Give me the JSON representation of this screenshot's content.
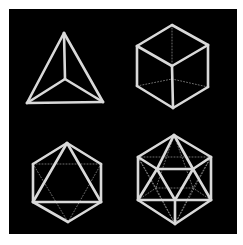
{
  "colors": {
    "background": "#000000",
    "page": "#ffffff",
    "edge": "#d9d9d9",
    "hidden_edge": "#8a8a8a"
  },
  "solids": [
    {
      "name": "tetrahedron",
      "visible_edges": [
        [
          [
            64,
            33
          ],
          [
            27,
            103
          ]
        ],
        [
          [
            64,
            33
          ],
          [
            103,
            102
          ]
        ],
        [
          [
            27,
            103
          ],
          [
            103,
            102
          ]
        ],
        [
          [
            64,
            33
          ],
          [
            65,
            79
          ]
        ],
        [
          [
            27,
            103
          ],
          [
            65,
            79
          ]
        ],
        [
          [
            103,
            102
          ],
          [
            65,
            79
          ]
        ]
      ],
      "hidden_edges": []
    },
    {
      "name": "cube",
      "visible_edges": [
        [
          [
            172,
            25
          ],
          [
            137,
            46
          ]
        ],
        [
          [
            172,
            25
          ],
          [
            208,
            45
          ]
        ],
        [
          [
            137,
            46
          ],
          [
            172,
            66
          ]
        ],
        [
          [
            208,
            45
          ],
          [
            172,
            66
          ]
        ],
        [
          [
            137,
            46
          ],
          [
            137,
            86
          ]
        ],
        [
          [
            208,
            45
          ],
          [
            208,
            87
          ]
        ],
        [
          [
            172,
            66
          ],
          [
            173,
            108
          ]
        ],
        [
          [
            137,
            86
          ],
          [
            173,
            108
          ]
        ],
        [
          [
            208,
            87
          ],
          [
            173,
            108
          ]
        ]
      ],
      "hidden_edges": [
        [
          [
            172,
            25
          ],
          [
            172,
            79
          ]
        ],
        [
          [
            137,
            86
          ],
          [
            172,
            79
          ]
        ],
        [
          [
            208,
            87
          ],
          [
            172,
            79
          ]
        ]
      ]
    },
    {
      "name": "octahedron",
      "visible_edges": [
        [
          [
            67,
            143
          ],
          [
            33,
            164
          ]
        ],
        [
          [
            67,
            143
          ],
          [
            101,
            164
          ]
        ],
        [
          [
            33,
            164
          ],
          [
            33,
            202
          ]
        ],
        [
          [
            101,
            164
          ],
          [
            101,
            202
          ]
        ],
        [
          [
            33,
            202
          ],
          [
            68,
            222
          ]
        ],
        [
          [
            101,
            202
          ],
          [
            68,
            222
          ]
        ],
        [
          [
            67,
            143
          ],
          [
            33,
            202
          ]
        ],
        [
          [
            67,
            143
          ],
          [
            101,
            202
          ]
        ],
        [
          [
            33,
            202
          ],
          [
            101,
            202
          ]
        ]
      ],
      "hidden_edges": [
        [
          [
            33,
            164
          ],
          [
            101,
            164
          ]
        ],
        [
          [
            33,
            164
          ],
          [
            68,
            222
          ]
        ],
        [
          [
            101,
            164
          ],
          [
            68,
            222
          ]
        ]
      ]
    },
    {
      "name": "icosahedron",
      "visible_edges": [
        [
          [
            174,
            135
          ],
          [
            138,
            157
          ]
        ],
        [
          [
            174,
            135
          ],
          [
            211,
            157
          ]
        ],
        [
          [
            138,
            157
          ],
          [
            138,
            200
          ]
        ],
        [
          [
            211,
            157
          ],
          [
            211,
            200
          ]
        ],
        [
          [
            138,
            200
          ],
          [
            175,
            224
          ]
        ],
        [
          [
            211,
            200
          ],
          [
            175,
            224
          ]
        ],
        [
          [
            174,
            135
          ],
          [
            157,
            169
          ]
        ],
        [
          [
            174,
            135
          ],
          [
            193,
            169
          ]
        ],
        [
          [
            157,
            169
          ],
          [
            193,
            169
          ]
        ],
        [
          [
            157,
            169
          ],
          [
            175,
            200
          ]
        ],
        [
          [
            193,
            169
          ],
          [
            175,
            200
          ]
        ],
        [
          [
            138,
            157
          ],
          [
            157,
            169
          ]
        ],
        [
          [
            211,
            157
          ],
          [
            193,
            169
          ]
        ],
        [
          [
            138,
            200
          ],
          [
            157,
            169
          ]
        ],
        [
          [
            211,
            200
          ],
          [
            193,
            169
          ]
        ],
        [
          [
            138,
            200
          ],
          [
            211,
            200
          ]
        ],
        [
          [
            175,
            200
          ],
          [
            175,
            224
          ]
        ]
      ],
      "hidden_edges": [
        [
          [
            138,
            157
          ],
          [
            211,
            157
          ]
        ],
        [
          [
            138,
            157
          ],
          [
            175,
            224
          ]
        ],
        [
          [
            211,
            157
          ],
          [
            175,
            224
          ]
        ],
        [
          [
            174,
            135
          ],
          [
            156,
            188
          ]
        ],
        [
          [
            174,
            135
          ],
          [
            193,
            188
          ]
        ],
        [
          [
            138,
            157
          ],
          [
            156,
            188
          ]
        ],
        [
          [
            211,
            157
          ],
          [
            193,
            188
          ]
        ],
        [
          [
            138,
            200
          ],
          [
            156,
            188
          ]
        ],
        [
          [
            211,
            200
          ],
          [
            193,
            188
          ]
        ],
        [
          [
            156,
            188
          ],
          [
            193,
            188
          ]
        ],
        [
          [
            156,
            188
          ],
          [
            175,
            224
          ]
        ],
        [
          [
            193,
            188
          ],
          [
            175,
            224
          ]
        ]
      ]
    }
  ]
}
